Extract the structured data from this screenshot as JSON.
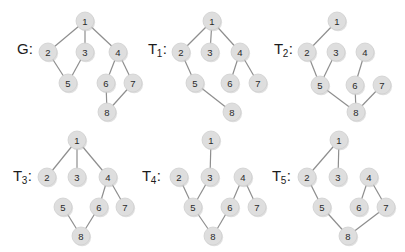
{
  "figure": {
    "background_color": "#ffffff",
    "node_fill_color": "#dedede",
    "node_text_color": "#2a2a2a",
    "edge_color": "#8e8e8e",
    "node_radius": 9
  },
  "panels": [
    {
      "id": "G",
      "label_main": "G",
      "label_sub": "",
      "label_colon": ":",
      "label_x": 17,
      "label_y": 41,
      "origin_x": 0,
      "origin_y": 0,
      "nodes": [
        {
          "id": "1",
          "x": 85,
          "y": 21
        },
        {
          "id": "2",
          "x": 48,
          "y": 52
        },
        {
          "id": "3",
          "x": 85,
          "y": 52
        },
        {
          "id": "4",
          "x": 118,
          "y": 52
        },
        {
          "id": "5",
          "x": 68,
          "y": 83
        },
        {
          "id": "6",
          "x": 106,
          "y": 83
        },
        {
          "id": "7",
          "x": 133,
          "y": 83
        },
        {
          "id": "8",
          "x": 107,
          "y": 112
        }
      ],
      "edges": [
        {
          "from": "1",
          "to": "2"
        },
        {
          "from": "1",
          "to": "3"
        },
        {
          "from": "1",
          "to": "4"
        },
        {
          "from": "2",
          "to": "5"
        },
        {
          "from": "3",
          "to": "5"
        },
        {
          "from": "4",
          "to": "6"
        },
        {
          "from": "4",
          "to": "7"
        },
        {
          "from": "6",
          "to": "8"
        },
        {
          "from": "7",
          "to": "8"
        }
      ]
    },
    {
      "id": "T1",
      "label_main": "T",
      "label_sub": "1",
      "label_colon": ":",
      "label_x": 148,
      "label_y": 41,
      "origin_x": 0,
      "origin_y": 0,
      "nodes": [
        {
          "id": "1",
          "x": 212,
          "y": 21
        },
        {
          "id": "2",
          "x": 181,
          "y": 52
        },
        {
          "id": "3",
          "x": 210,
          "y": 52
        },
        {
          "id": "4",
          "x": 240,
          "y": 52
        },
        {
          "id": "5",
          "x": 195,
          "y": 83
        },
        {
          "id": "6",
          "x": 230,
          "y": 83
        },
        {
          "id": "7",
          "x": 258,
          "y": 83
        },
        {
          "id": "8",
          "x": 232,
          "y": 112
        }
      ],
      "edges": [
        {
          "from": "1",
          "to": "2"
        },
        {
          "from": "1",
          "to": "3"
        },
        {
          "from": "1",
          "to": "4"
        },
        {
          "from": "2",
          "to": "5"
        },
        {
          "from": "4",
          "to": "6"
        },
        {
          "from": "4",
          "to": "7"
        },
        {
          "from": "5",
          "to": "8"
        }
      ]
    },
    {
      "id": "T2",
      "label_main": "T",
      "label_sub": "2",
      "label_colon": ":",
      "label_x": 274,
      "label_y": 41,
      "origin_x": 0,
      "origin_y": 0,
      "nodes": [
        {
          "id": "1",
          "x": 337,
          "y": 21
        },
        {
          "id": "2",
          "x": 307,
          "y": 52
        },
        {
          "id": "3",
          "x": 336,
          "y": 52
        },
        {
          "id": "4",
          "x": 365,
          "y": 52
        },
        {
          "id": "5",
          "x": 320,
          "y": 85
        },
        {
          "id": "6",
          "x": 355,
          "y": 85
        },
        {
          "id": "7",
          "x": 382,
          "y": 85
        },
        {
          "id": "8",
          "x": 356,
          "y": 112
        }
      ],
      "edges": [
        {
          "from": "1",
          "to": "2"
        },
        {
          "from": "2",
          "to": "5"
        },
        {
          "from": "3",
          "to": "5"
        },
        {
          "from": "4",
          "to": "6"
        },
        {
          "from": "5",
          "to": "8"
        },
        {
          "from": "6",
          "to": "8"
        },
        {
          "from": "7",
          "to": "8"
        }
      ]
    },
    {
      "id": "T3",
      "label_main": "T",
      "label_sub": "3",
      "label_colon": ":",
      "label_x": 13,
      "label_y": 168,
      "origin_x": 0,
      "origin_y": 0,
      "nodes": [
        {
          "id": "1",
          "x": 77,
          "y": 140
        },
        {
          "id": "2",
          "x": 47,
          "y": 177
        },
        {
          "id": "3",
          "x": 77,
          "y": 177
        },
        {
          "id": "4",
          "x": 108,
          "y": 177
        },
        {
          "id": "5",
          "x": 63,
          "y": 207
        },
        {
          "id": "6",
          "x": 99,
          "y": 207
        },
        {
          "id": "7",
          "x": 125,
          "y": 207
        },
        {
          "id": "8",
          "x": 81,
          "y": 236
        }
      ],
      "edges": [
        {
          "from": "1",
          "to": "2"
        },
        {
          "from": "1",
          "to": "3"
        },
        {
          "from": "1",
          "to": "4"
        },
        {
          "from": "4",
          "to": "6"
        },
        {
          "from": "4",
          "to": "7"
        },
        {
          "from": "5",
          "to": "8"
        },
        {
          "from": "6",
          "to": "8"
        }
      ]
    },
    {
      "id": "T4",
      "label_main": "T",
      "label_sub": "4",
      "label_colon": ":",
      "label_x": 142,
      "label_y": 168,
      "origin_x": 0,
      "origin_y": 0,
      "nodes": [
        {
          "id": "1",
          "x": 211,
          "y": 140
        },
        {
          "id": "2",
          "x": 179,
          "y": 177
        },
        {
          "id": "3",
          "x": 210,
          "y": 177
        },
        {
          "id": "4",
          "x": 243,
          "y": 177
        },
        {
          "id": "5",
          "x": 193,
          "y": 207
        },
        {
          "id": "6",
          "x": 230,
          "y": 207
        },
        {
          "id": "7",
          "x": 257,
          "y": 207
        },
        {
          "id": "8",
          "x": 213,
          "y": 236
        }
      ],
      "edges": [
        {
          "from": "1",
          "to": "3"
        },
        {
          "from": "2",
          "to": "5"
        },
        {
          "from": "3",
          "to": "5"
        },
        {
          "from": "4",
          "to": "6"
        },
        {
          "from": "4",
          "to": "7"
        },
        {
          "from": "5",
          "to": "8"
        },
        {
          "from": "6",
          "to": "8"
        }
      ]
    },
    {
      "id": "T5",
      "label_main": "T",
      "label_sub": "5",
      "label_colon": ":",
      "label_x": 272,
      "label_y": 168,
      "origin_x": 0,
      "origin_y": 0,
      "nodes": [
        {
          "id": "1",
          "x": 339,
          "y": 140
        },
        {
          "id": "2",
          "x": 307,
          "y": 177
        },
        {
          "id": "3",
          "x": 338,
          "y": 177
        },
        {
          "id": "4",
          "x": 369,
          "y": 177
        },
        {
          "id": "5",
          "x": 322,
          "y": 207
        },
        {
          "id": "6",
          "x": 359,
          "y": 207
        },
        {
          "id": "7",
          "x": 386,
          "y": 207
        },
        {
          "id": "8",
          "x": 348,
          "y": 236
        }
      ],
      "edges": [
        {
          "from": "1",
          "to": "2"
        },
        {
          "from": "1",
          "to": "3"
        },
        {
          "from": "2",
          "to": "5"
        },
        {
          "from": "4",
          "to": "6"
        },
        {
          "from": "4",
          "to": "7"
        },
        {
          "from": "5",
          "to": "8"
        },
        {
          "from": "7",
          "to": "8"
        }
      ]
    }
  ]
}
